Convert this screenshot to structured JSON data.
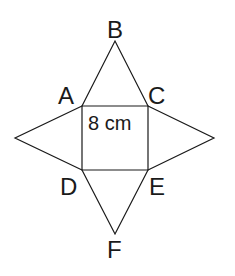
{
  "diagram": {
    "type": "net",
    "stroke_color": "#1a1a1a",
    "background": "#ffffff",
    "vertices": {
      "A": {
        "label": "A",
        "x": 82,
        "y": 106
      },
      "B": {
        "label": "B",
        "x": 115,
        "y": 41
      },
      "C": {
        "label": "C",
        "x": 148,
        "y": 106
      },
      "D": {
        "label": "D",
        "x": 82,
        "y": 170
      },
      "E": {
        "label": "E",
        "x": 148,
        "y": 170
      },
      "F": {
        "label": "F",
        "x": 115,
        "y": 234
      },
      "L": {
        "label": "",
        "x": 15,
        "y": 138
      },
      "R": {
        "label": "",
        "x": 214,
        "y": 138
      }
    },
    "square": {
      "vertices": [
        "A",
        "C",
        "E",
        "D"
      ],
      "side_label": "8 cm"
    },
    "triangles": [
      {
        "name": "top",
        "vertices": [
          "A",
          "B",
          "C"
        ]
      },
      {
        "name": "left",
        "vertices": [
          "A",
          "L",
          "D"
        ]
      },
      {
        "name": "right",
        "vertices": [
          "C",
          "R",
          "E"
        ]
      },
      {
        "name": "bottom",
        "vertices": [
          "D",
          "F",
          "E"
        ]
      }
    ],
    "labels": {
      "A": "A",
      "B": "B",
      "C": "C",
      "D": "D",
      "E": "E",
      "F": "F",
      "measurement": "8 cm"
    }
  }
}
